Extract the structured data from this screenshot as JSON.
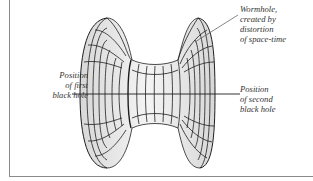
{
  "figure": {
    "labels": {
      "left": [
        "Position",
        "of first",
        "black hole"
      ],
      "wormhole": [
        "Wormhole,",
        "created by",
        "distortion",
        "of space-time"
      ],
      "right": [
        "Position",
        "of second",
        "black hole"
      ]
    },
    "colors": {
      "line": "#1e1e1e",
      "frame": "#8a8a8a",
      "shading": "#e6e6e6",
      "text": "#333333"
    }
  }
}
